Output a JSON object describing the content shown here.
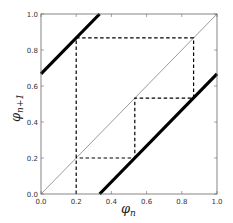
{
  "chart_data": {
    "type": "line",
    "title": "",
    "xlabel": "φ_n",
    "ylabel": "φ_{n+1}",
    "xlabel_main": "φ",
    "xlabel_sub": "n",
    "ylabel_main": "φ",
    "ylabel_sub": "n+1",
    "xlim": [
      0.0,
      1.0
    ],
    "ylim": [
      0.0,
      1.0
    ],
    "xticks": [
      0.0,
      0.2,
      0.4,
      0.6,
      0.8,
      1.0
    ],
    "yticks": [
      0.0,
      0.2,
      0.4,
      0.6,
      0.8,
      1.0
    ],
    "xtick_labels": [
      "0.0",
      "0.2",
      "0.4",
      "0.6",
      "0.8",
      "1.0"
    ],
    "ytick_labels": [
      "0.0",
      "0.2",
      "0.4",
      "0.6",
      "0.8",
      "1.0"
    ],
    "grid": false,
    "legend": null,
    "series": [
      {
        "name": "diagonal (φ_{n+1} = φ_n)",
        "style": "thin-solid",
        "color": "#555555",
        "x": [
          0.0,
          1.0
        ],
        "y": [
          0.0,
          1.0
        ]
      },
      {
        "name": "map branch 1 (φ_{n+1} = φ_n + 2/3)",
        "style": "thick-solid",
        "color": "#000000",
        "x": [
          0.0,
          0.333
        ],
        "y": [
          0.667,
          1.0
        ]
      },
      {
        "name": "map branch 2 (φ_{n+1} = φ_n - 1/3)",
        "style": "thick-solid",
        "color": "#000000",
        "x": [
          0.333,
          1.0
        ],
        "y": [
          0.0,
          0.667
        ]
      },
      {
        "name": "cobweb orbit",
        "style": "dashed",
        "color": "#000000",
        "x": [
          0.2,
          0.2,
          0.867,
          0.867,
          0.533,
          0.533,
          0.2,
          0.2
        ],
        "y": [
          0.0,
          0.867,
          0.867,
          0.533,
          0.533,
          0.2,
          0.2,
          0.2
        ]
      }
    ]
  }
}
